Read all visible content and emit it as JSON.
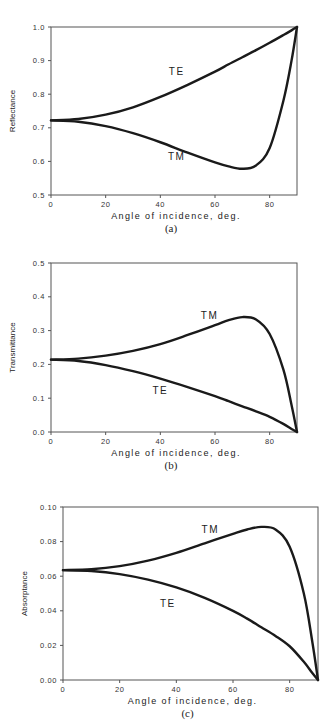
{
  "chart_data": [
    {
      "id": "a",
      "type": "line",
      "caption": "(a)",
      "xlabel": "Angle of incidence, deg.",
      "ylabel": "Reflectance",
      "xlim": [
        0,
        90
      ],
      "ylim": [
        0.5,
        1.0
      ],
      "xticks": [
        0,
        20,
        40,
        60,
        80
      ],
      "yticks": [
        0.5,
        0.6,
        0.7,
        0.8,
        0.9,
        1.0
      ],
      "ytick_labels": [
        "0.5",
        "0.6",
        "0.7",
        "0.8",
        "0.9",
        "1.0"
      ],
      "grid": false,
      "x": [
        0,
        10,
        20,
        30,
        40,
        50,
        60,
        65,
        70,
        75,
        80,
        85,
        88,
        90
      ],
      "series": [
        {
          "name": "TE",
          "label_pos": [
            46,
            0.87
          ],
          "values": [
            0.722,
            0.726,
            0.739,
            0.761,
            0.792,
            0.828,
            0.867,
            0.889,
            0.91,
            0.931,
            0.953,
            0.976,
            0.99,
            1.0
          ]
        },
        {
          "name": "TM",
          "label_pos": [
            46,
            0.615
          ],
          "values": [
            0.722,
            0.718,
            0.705,
            0.684,
            0.657,
            0.626,
            0.597,
            0.585,
            0.578,
            0.588,
            0.64,
            0.78,
            0.9,
            1.0
          ]
        }
      ]
    },
    {
      "id": "b",
      "type": "line",
      "caption": "(b)",
      "xlabel": "Angle of incidence, deg.",
      "ylabel": "Transmittance",
      "xlim": [
        0,
        90
      ],
      "ylim": [
        0.0,
        0.5
      ],
      "xticks": [
        0,
        20,
        40,
        60,
        80
      ],
      "yticks": [
        0.0,
        0.1,
        0.2,
        0.3,
        0.4,
        0.5
      ],
      "ytick_labels": [
        "0.0",
        "0.1",
        "0.2",
        "0.3",
        "0.4",
        "0.5"
      ],
      "grid": false,
      "x": [
        0,
        10,
        20,
        30,
        40,
        50,
        60,
        65,
        70,
        75,
        80,
        85,
        88,
        90
      ],
      "series": [
        {
          "name": "TM",
          "label_pos": [
            58,
            0.345
          ],
          "values": [
            0.214,
            0.217,
            0.226,
            0.24,
            0.26,
            0.287,
            0.316,
            0.331,
            0.34,
            0.333,
            0.29,
            0.185,
            0.08,
            0.0
          ]
        },
        {
          "name": "TE",
          "label_pos": [
            40,
            0.125
          ],
          "values": [
            0.214,
            0.21,
            0.198,
            0.18,
            0.158,
            0.133,
            0.106,
            0.091,
            0.076,
            0.061,
            0.045,
            0.024,
            0.009,
            0.0
          ]
        }
      ]
    },
    {
      "id": "c",
      "type": "line",
      "caption": "(c)",
      "xlabel": "Angle of incidence, deg.",
      "ylabel": "Absorptance",
      "xlim": [
        0,
        90
      ],
      "ylim": [
        0.0,
        0.1
      ],
      "xticks": [
        0,
        20,
        40,
        60,
        80
      ],
      "yticks": [
        0.0,
        0.02,
        0.04,
        0.06,
        0.08,
        0.1
      ],
      "ytick_labels": [
        "0.00",
        "0.02",
        "0.04",
        "0.06",
        "0.08",
        "0.10"
      ],
      "grid": false,
      "x": [
        0,
        10,
        20,
        30,
        40,
        50,
        60,
        65,
        70,
        75,
        80,
        85,
        88,
        90
      ],
      "series": [
        {
          "name": "TM",
          "label_pos": [
            52,
            0.0875
          ],
          "values": [
            0.0635,
            0.064,
            0.0658,
            0.069,
            0.0735,
            0.079,
            0.0845,
            0.087,
            0.0885,
            0.087,
            0.077,
            0.05,
            0.022,
            0.0
          ]
        },
        {
          "name": "TE",
          "label_pos": [
            37,
            0.0445
          ],
          "values": [
            0.0635,
            0.063,
            0.0612,
            0.058,
            0.0535,
            0.0475,
            0.04,
            0.0355,
            0.0305,
            0.0255,
            0.0195,
            0.0105,
            0.004,
            0.0
          ]
        }
      ]
    }
  ]
}
